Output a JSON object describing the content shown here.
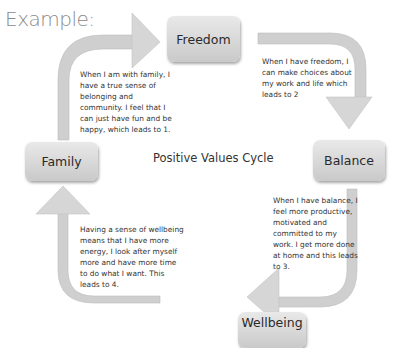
{
  "heading": "Example:",
  "center_title": "Positive Values Cycle",
  "nodes": {
    "freedom": "Freedom",
    "balance": "Balance",
    "wellbeing": "Wellbeing",
    "family": "Family"
  },
  "descriptions": {
    "family_to_freedom": [
      "When I am with family, I",
      "have a true sense of",
      "belonging and",
      "community. I feel that I",
      "can just have fun and be",
      "happy, which leads to 1."
    ],
    "freedom_to_balance": [
      "When I have freedom, I",
      "can make choices about",
      "my work and life which",
      "leads to 2"
    ],
    "balance_to_wellbeing": [
      "When I have balance, I",
      "feel more productive,",
      "motivated and",
      "committed to my",
      "work. I get more done",
      "at home and this leads",
      "to 3."
    ],
    "wellbeing_to_family": [
      "Having a sense of wellbeing",
      "means that I have more",
      "energy, I look after myself",
      "more and have more time",
      "to do what I want. This",
      "leads to 4."
    ]
  },
  "colors": {
    "box_top": "#e9e9e9",
    "box_bottom": "#c9c9c9",
    "arrow_fill": "#d0d0d0",
    "text": "#333333",
    "heading": "#8a8a8a"
  }
}
